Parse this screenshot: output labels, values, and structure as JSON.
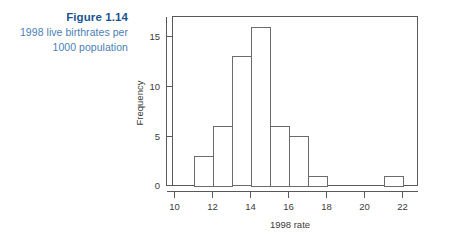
{
  "caption": {
    "figure_number": "Figure 1.14",
    "description_line1": "1998 live birthrates per",
    "description_line2": "1000 population",
    "number_color": "#1a5490",
    "description_color": "#4a7fb5"
  },
  "chart_data": {
    "type": "bar",
    "subtype": "histogram",
    "title": "",
    "xlabel": "1998 rate",
    "ylabel": "Frequency",
    "xlim": [
      10,
      22.5
    ],
    "ylim": [
      0,
      17
    ],
    "grid": false,
    "legend": null,
    "bin_width": 1,
    "bin_edges": [
      11,
      12,
      13,
      14,
      15,
      16,
      17,
      18,
      21,
      22
    ],
    "bins": [
      {
        "start": 11,
        "end": 12,
        "frequency": 3
      },
      {
        "start": 12,
        "end": 13,
        "frequency": 6
      },
      {
        "start": 13,
        "end": 14,
        "frequency": 13
      },
      {
        "start": 14,
        "end": 15,
        "frequency": 16
      },
      {
        "start": 15,
        "end": 16,
        "frequency": 6
      },
      {
        "start": 16,
        "end": 17,
        "frequency": 5
      },
      {
        "start": 17,
        "end": 18,
        "frequency": 1
      },
      {
        "start": 21,
        "end": 22,
        "frequency": 1
      }
    ],
    "categories": [
      "11-12",
      "12-13",
      "13-14",
      "14-15",
      "15-16",
      "16-17",
      "17-18",
      "21-22"
    ],
    "values": [
      3,
      6,
      13,
      16,
      6,
      5,
      1,
      1
    ],
    "x_ticks": [
      10,
      12,
      14,
      16,
      18,
      20,
      22
    ],
    "x_tick_labels": [
      "10",
      "12",
      "14",
      "16",
      "18",
      "20",
      "22"
    ],
    "y_ticks": [
      0,
      5,
      10,
      15
    ],
    "y_tick_labels": [
      "0",
      "5",
      "10",
      "15"
    ],
    "bar_fill": "#ffffff",
    "bar_stroke": "#6b6b6b",
    "axis_color": "#595959"
  }
}
